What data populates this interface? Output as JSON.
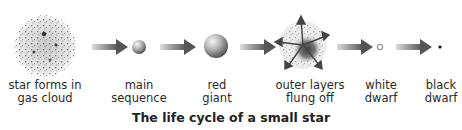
{
  "diagram": {
    "title": "The life cycle of a small star",
    "stages": [
      {
        "id": "gas-cloud",
        "line1": "star forms in",
        "line2": "gas cloud",
        "cx": 45
      },
      {
        "id": "main-sequence",
        "line1": "main",
        "line2": "sequence",
        "cx": 139
      },
      {
        "id": "red-giant",
        "line1": "red",
        "line2": "giant",
        "cx": 217
      },
      {
        "id": "outer-layers",
        "line1": "outer layers",
        "line2": "flung off",
        "cx": 310
      },
      {
        "id": "white-dwarf",
        "line1": "white",
        "line2": "dwarf",
        "cx": 381
      },
      {
        "id": "black-dwarf",
        "line1": "black",
        "line2": "dwarf",
        "cx": 441
      }
    ],
    "arrows": 5,
    "colors": {
      "arrow_start": "#d8d8d8",
      "arrow_end": "#5a5a5a",
      "sphere_light": "#f4f4f4",
      "sphere_dark": "#555555",
      "text": "#2a2a2a"
    }
  }
}
